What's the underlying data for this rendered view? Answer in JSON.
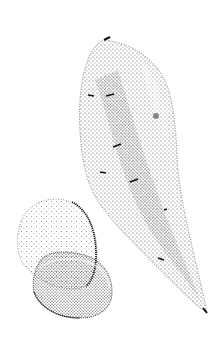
{
  "illustration": {
    "subject": "sweet potatoes stipple drawing",
    "background": "#ffffff",
    "ink": "#1a1a1a"
  }
}
